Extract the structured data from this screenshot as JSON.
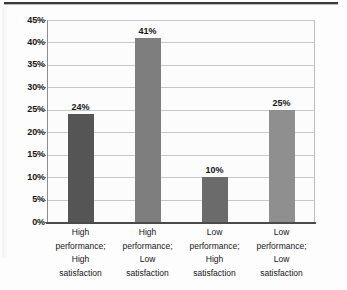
{
  "chart_data": {
    "type": "bar",
    "title": "",
    "subtitle": "",
    "xlabel": "",
    "ylabel": "",
    "categories": [
      "High performance; High satisfaction",
      "High performance; Low satisfaction",
      "Low performance; High satisfaction",
      "Low performance; Low satisfaction"
    ],
    "category_lines": [
      [
        "High",
        "performance;",
        "High",
        "satisfaction"
      ],
      [
        "High",
        "performance;",
        "Low",
        "satisfaction"
      ],
      [
        "Low",
        "performance;",
        "High",
        "satisfaction"
      ],
      [
        "Low",
        "performance;",
        "Low",
        "satisfaction"
      ]
    ],
    "values": [
      24,
      41,
      10,
      25
    ],
    "value_labels": [
      "24%",
      "41%",
      "10%",
      "25%"
    ],
    "bar_colors": [
      "#555555",
      "#7e7e7e",
      "#6b6b6b",
      "#8f8f8f"
    ],
    "ylim": [
      0,
      45
    ],
    "ytick_values": [
      45,
      40,
      35,
      30,
      25,
      20,
      15,
      10,
      5,
      0
    ],
    "ytick_labels": [
      "45%",
      "40%",
      "35%",
      "30%",
      "25%",
      "20%",
      "15%",
      "10%",
      "5%",
      "0%"
    ],
    "grid": true,
    "grid_color": "#c8c8c8",
    "legend": "none",
    "axis_color": "#4a4a4a",
    "plot_background": "#fcfcfc"
  }
}
